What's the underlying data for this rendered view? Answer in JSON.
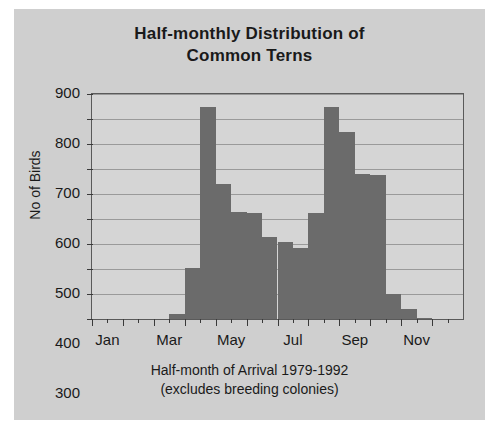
{
  "chart_data": {
    "type": "bar",
    "title": "Half-monthly Distribution of Common Terns",
    "title_line1": "Half-monthly Distribution of",
    "title_line2": "Common Terns",
    "xlabel": "Half-month of Arrival 1979-1992",
    "xlabel_line2": "(excludes breeding colonies)",
    "ylabel": "No of Birds",
    "ylim": [
      0,
      900
    ],
    "ytick_values": [
      0,
      100,
      200,
      300,
      400,
      500,
      600,
      700,
      800,
      900
    ],
    "ytick_labels": [
      "0",
      "100",
      "200",
      "300",
      "400",
      "500",
      "600",
      "700",
      "800",
      "900"
    ],
    "grid": true,
    "legend": "none",
    "bar_color": "#6b6b6b",
    "plot_bg": "#d5d5d5",
    "panel_bg": "#cfcfcf",
    "axis_color": "#5a5a5a",
    "categories": [
      "Jan-1",
      "Jan-2",
      "Feb-1",
      "Feb-2",
      "Mar-1",
      "Mar-2",
      "Apr-1",
      "Apr-2",
      "May-1",
      "May-2",
      "Jun-1",
      "Jun-2",
      "Jul-1",
      "Jul-2",
      "Aug-1",
      "Aug-2",
      "Sep-1",
      "Sep-2",
      "Oct-1",
      "Oct-2",
      "Nov-1",
      "Nov-2",
      "Dec-1",
      "Dec-2"
    ],
    "values": [
      0,
      0,
      0,
      0,
      0,
      20,
      205,
      850,
      540,
      430,
      425,
      330,
      310,
      285,
      425,
      850,
      750,
      580,
      575,
      100,
      40,
      5,
      0,
      0
    ],
    "xtick_labels": [
      "Jan",
      "Mar",
      "May",
      "Jul",
      "Sep",
      "Nov"
    ],
    "xtick_categories": [
      "Jan",
      "Mar",
      "May",
      "Jul",
      "Sep",
      "Nov"
    ]
  }
}
